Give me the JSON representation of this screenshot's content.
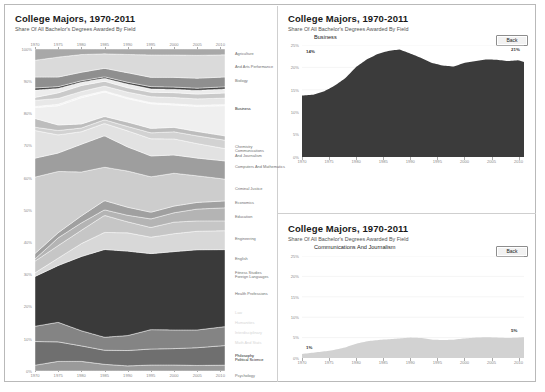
{
  "app": {
    "window_background": "#ffffff",
    "border_color": "#b9b9b9"
  },
  "main_panel": {
    "title": "College Majors, 1970-2011",
    "subtitle": "Share Of All Bachelor's Degrees Awarded By Field"
  },
  "detail_top": {
    "title": "College Majors, 1970-2011",
    "subtitle": "Share Of All Bachelor's Degrees Awarded By Field",
    "series_label": "Business",
    "back_label": "Back",
    "start_annotation": "14%",
    "end_annotation": "21%"
  },
  "detail_bottom": {
    "title": "College Majors, 1970-2011",
    "subtitle": "Share Of All Bachelor's Degrees Awarded By Field",
    "series_label": "Communications And Journalism",
    "back_label": "Back",
    "start_annotation": "1%",
    "end_annotation": "5%"
  },
  "chart_data": [
    {
      "id": "main-stacked-area",
      "type": "area",
      "title": "College Majors, 1970-2011",
      "subtitle": "Share Of All Bachelor's Degrees Awarded By Field",
      "xlabel": "",
      "ylabel": "",
      "stacked": true,
      "normalized": true,
      "grid": false,
      "legend_position": "right",
      "xlim": [
        1970,
        2011
      ],
      "ylim": [
        0,
        100
      ],
      "x_ticks": [
        1970,
        1975,
        1980,
        1985,
        1990,
        1995,
        2000,
        2005,
        2010
      ],
      "x_tick_labels": [
        "1970",
        "1975",
        "1980",
        "1985",
        "1990",
        "1995",
        "2000",
        "2005",
        "2010"
      ],
      "y_ticks": [
        0,
        10,
        20,
        30,
        40,
        50,
        60,
        70,
        80,
        90,
        100
      ],
      "y_tick_labels": [
        "0%",
        "10%",
        "20%",
        "30%",
        "40%",
        "50%",
        "60%",
        "70%",
        "80%",
        "90%",
        "100%"
      ],
      "x": [
        1970,
        1975,
        1980,
        1985,
        1990,
        1995,
        2000,
        2005,
        2011
      ],
      "series": [
        {
          "name": "Agriculture",
          "color": "#9a9a9a",
          "values": [
            1.6,
            2.6,
            2.6,
            1.8,
            1.4,
            1.6,
            1.6,
            1.5,
            1.6
          ]
        },
        {
          "name": "And Arts Performance",
          "color": "#6f6f6f",
          "values": [
            6.5,
            5.3,
            4.2,
            3.8,
            4.2,
            4.3,
            4.4,
            4.8,
            5.4
          ]
        },
        {
          "name": "Biology",
          "color": "#848484",
          "values": [
            4.2,
            5.3,
            4.1,
            3.5,
            4.1,
            5.2,
            5.0,
            4.8,
            5.2
          ]
        },
        {
          "name": "Business",
          "color": "#3a3a3a",
          "values": [
            13.7,
            15.4,
            20.1,
            23.7,
            23.1,
            20.4,
            21.0,
            21.7,
            21.2
          ]
        },
        {
          "name": "Communications And Journalism",
          "color": "#d8d8d8",
          "values": [
            1.0,
            2.0,
            3.5,
            4.6,
            5.0,
            4.4,
            4.8,
            5.0,
            5.2
          ]
        },
        {
          "name": "Computers And Mathematics",
          "color": "#c6c6c6",
          "values": [
            3.2,
            3.4,
            3.6,
            4.6,
            3.0,
            2.6,
            3.1,
            2.8,
            2.7
          ]
        },
        {
          "name": "Criminal Justice",
          "color": "#b4b4b4",
          "values": [
            0.6,
            2.1,
            2.0,
            1.5,
            1.8,
            2.3,
            2.5,
            3.2,
            3.6
          ]
        },
        {
          "name": "Economics",
          "color": "#a0a0a0",
          "values": [
            1.5,
            1.4,
            1.9,
            2.5,
            2.2,
            1.8,
            1.8,
            1.8,
            1.9
          ]
        },
        {
          "name": "Education",
          "color": "#cdcdcd",
          "values": [
            21.0,
            16.6,
            11.9,
            9.0,
            9.9,
            9.5,
            8.8,
            7.2,
            6.0
          ]
        },
        {
          "name": "Engineering",
          "color": "#9e9e9e",
          "values": [
            5.2,
            5.0,
            7.5,
            8.5,
            6.6,
            5.6,
            4.9,
            4.8,
            5.0
          ]
        },
        {
          "name": "English",
          "color": "#e2e2e2",
          "values": [
            7.6,
            4.9,
            3.4,
            3.3,
            4.4,
            4.6,
            4.3,
            3.9,
            3.4
          ]
        },
        {
          "name": "Fitness Studies",
          "color": "#d2d2d2",
          "values": [
            0.9,
            1.2,
            1.0,
            1.0,
            1.2,
            1.6,
            1.9,
            2.1,
            2.3
          ]
        },
        {
          "name": "Foreign Languages",
          "color": "#bdbdbd",
          "values": [
            2.4,
            1.5,
            1.1,
            0.9,
            1.2,
            1.2,
            1.2,
            1.2,
            1.2
          ]
        },
        {
          "name": "Health Professions",
          "color": "#efefef",
          "values": [
            3.0,
            5.2,
            7.1,
            6.6,
            6.4,
            6.6,
            6.0,
            6.8,
            8.3
          ]
        },
        {
          "name": "Law",
          "color": "#f3f3f3",
          "values": [
            0.3,
            0.4,
            0.4,
            0.3,
            0.3,
            0.3,
            0.3,
            0.3,
            0.3
          ]
        },
        {
          "name": "Humanities",
          "color": "#e8e8e8",
          "values": [
            1.7,
            1.6,
            1.3,
            1.3,
            1.5,
            1.6,
            1.7,
            1.7,
            1.8
          ]
        },
        {
          "name": "Interdisciplinary",
          "color": "#cacaca",
          "values": [
            0.8,
            1.5,
            1.6,
            1.3,
            1.2,
            1.2,
            1.3,
            1.3,
            1.4
          ]
        },
        {
          "name": "Math And Stats",
          "color": "#ededed",
          "values": [
            2.0,
            1.2,
            0.9,
            0.8,
            1.0,
            0.9,
            0.9,
            1.0,
            1.1
          ]
        },
        {
          "name": "Philosophy",
          "color": "#3f3f3f",
          "values": [
            0.6,
            0.5,
            0.4,
            0.4,
            0.5,
            0.6,
            0.6,
            0.6,
            0.6
          ]
        },
        {
          "name": "Political Science",
          "color": "#8f8f8f",
          "values": [
            3.0,
            2.6,
            2.3,
            2.3,
            2.6,
            2.5,
            2.6,
            2.7,
            2.7
          ]
        },
        {
          "name": "Psychology",
          "color": "#dadada",
          "values": [
            4.6,
            5.4,
            4.8,
            3.9,
            5.0,
            6.0,
            6.0,
            6.2,
            6.1
          ]
        },
        {
          "name": "Sociology",
          "color": "#a8a8a8",
          "values": [
            3.1,
            2.2,
            1.5,
            1.3,
            1.5,
            1.6,
            1.6,
            1.7,
            1.6
          ]
        }
      ]
    },
    {
      "id": "detail-business",
      "type": "area",
      "title": "College Majors, 1970-2011",
      "subtitle": "Share Of All Bachelor's Degrees Awarded By Field",
      "series_name": "Business",
      "color": "#3b3b3b",
      "grid": true,
      "xlim": [
        1970,
        2011
      ],
      "ylim": [
        0,
        25
      ],
      "x_ticks": [
        1970,
        1975,
        1980,
        1985,
        1990,
        1995,
        2000,
        2005,
        2010
      ],
      "x_tick_labels": [
        "1970",
        "1975",
        "1980",
        "1985",
        "1990",
        "1995",
        "2000",
        "2005",
        "2010"
      ],
      "y_ticks": [
        0,
        5,
        10,
        15,
        20,
        25
      ],
      "y_tick_labels": [
        "0%",
        "5%",
        "10%",
        "15%",
        "20%",
        "25%"
      ],
      "x": [
        1970,
        1972,
        1974,
        1976,
        1978,
        1980,
        1982,
        1984,
        1986,
        1988,
        1990,
        1992,
        1994,
        1996,
        1998,
        2000,
        2002,
        2004,
        2006,
        2008,
        2010,
        2011
      ],
      "values": [
        13.7,
        13.9,
        14.6,
        15.9,
        17.6,
        20.1,
        21.8,
        23.0,
        23.7,
        24.0,
        23.1,
        22.1,
        21.0,
        20.4,
        20.2,
        21.0,
        21.4,
        21.8,
        21.7,
        21.4,
        21.6,
        21.2
      ]
    },
    {
      "id": "detail-communications",
      "type": "area",
      "title": "College Majors, 1970-2011",
      "subtitle": "Share Of All Bachelor's Degrees Awarded By Field",
      "series_name": "Communications And Journalism",
      "color": "#d2d2d2",
      "grid": true,
      "xlim": [
        1970,
        2011
      ],
      "ylim": [
        0,
        25
      ],
      "x_ticks": [
        1970,
        1975,
        1980,
        1985,
        1990,
        1995,
        2000,
        2005,
        2010
      ],
      "x_tick_labels": [
        "1970",
        "1975",
        "1980",
        "1985",
        "1990",
        "1995",
        "2000",
        "2005",
        "2010"
      ],
      "y_ticks": [
        0,
        5,
        10,
        15,
        20,
        25
      ],
      "y_tick_labels": [
        "0%",
        "5%",
        "10%",
        "15%",
        "20%",
        "25%"
      ],
      "x": [
        1970,
        1972,
        1974,
        1976,
        1978,
        1980,
        1982,
        1984,
        1986,
        1988,
        1990,
        1992,
        1994,
        1996,
        1998,
        2000,
        2002,
        2004,
        2006,
        2008,
        2010,
        2011
      ],
      "values": [
        1.0,
        1.3,
        1.6,
        2.0,
        2.6,
        3.5,
        4.1,
        4.4,
        4.6,
        4.8,
        5.0,
        4.9,
        4.5,
        4.4,
        4.5,
        4.8,
        5.0,
        5.1,
        5.0,
        4.9,
        5.0,
        5.1
      ]
    }
  ],
  "legend_labels": [
    "Agriculture",
    "And Arts Performance",
    "Biology",
    "Business",
    "Chemistry\nCommunications\nAnd Journalism",
    "Computers And Mathematics",
    "Criminal Justice",
    "Economics",
    "Education",
    "Engineering",
    "English",
    "Fitness Studies\nForeign Languages",
    "Health Professions",
    "Law",
    "Humanities",
    "Interdisciplinary",
    "Math And Stats",
    "Philosophy\nPolitical Science",
    "Psychology",
    "Sociology"
  ]
}
